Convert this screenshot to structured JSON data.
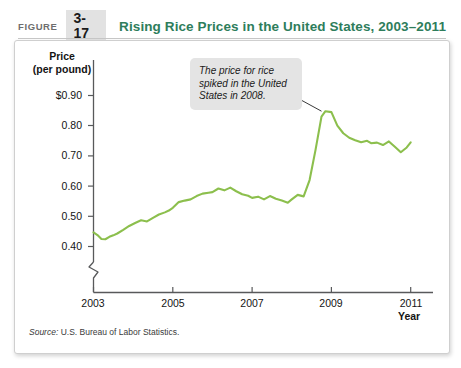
{
  "figure": {
    "label": "FIGURE",
    "number": "3-17",
    "title": "Rising Rice Prices in the United States, 2003–2011"
  },
  "axes": {
    "y_title_line1": "Price",
    "y_title_line2": "(per pound)",
    "x_title": "Year",
    "y_ticks": [
      "$0.90",
      "0.80",
      "0.70",
      "0.60",
      "0.50",
      "0.40"
    ],
    "x_ticks": [
      "2003",
      "2005",
      "2007",
      "2009",
      "2011"
    ]
  },
  "annotation": {
    "text": "The price for rice spiked in the United States in 2008."
  },
  "source": {
    "prefix": "Source:",
    "text": "U.S. Bureau of Labor Statistics."
  },
  "colors": {
    "line": "#8CBF4D",
    "title": "#2e7d5b",
    "figure_box_bg": "#e2e2e2",
    "callout_bg": "#e4e4e4",
    "axis": "#58595b"
  },
  "chart_data": {
    "type": "line",
    "title": "Rising Rice Prices in the United States, 2003–2011",
    "xlabel": "Year",
    "ylabel": "Price (per pound)",
    "xlim": [
      2003,
      2011.2
    ],
    "ylim": [
      0.37,
      0.93
    ],
    "ybreak": true,
    "grid": false,
    "legend": null,
    "series": [
      {
        "name": "Rice price (dollars per pound)",
        "x": [
          2003.0,
          2003.1,
          2003.2,
          2003.3,
          2003.4,
          2003.5,
          2003.6,
          2003.75,
          2003.9,
          2004.05,
          2004.2,
          2004.35,
          2004.5,
          2004.65,
          2004.8,
          2004.9,
          2005.0,
          2005.15,
          2005.3,
          2005.45,
          2005.6,
          2005.75,
          2005.9,
          2006.0,
          2006.15,
          2006.3,
          2006.45,
          2006.6,
          2006.75,
          2006.9,
          2007.0,
          2007.15,
          2007.3,
          2007.45,
          2007.6,
          2007.75,
          2007.9,
          2008.0,
          2008.15,
          2008.3,
          2008.45,
          2008.6,
          2008.75,
          2008.85,
          2009.0,
          2009.15,
          2009.3,
          2009.45,
          2009.6,
          2009.75,
          2009.9,
          2010.0,
          2010.15,
          2010.3,
          2010.45,
          2010.6,
          2010.75,
          2010.9,
          2011.0
        ],
        "y": [
          0.447,
          0.438,
          0.425,
          0.424,
          0.432,
          0.437,
          0.443,
          0.455,
          0.468,
          0.478,
          0.487,
          0.483,
          0.495,
          0.506,
          0.513,
          0.519,
          0.528,
          0.547,
          0.552,
          0.556,
          0.567,
          0.575,
          0.578,
          0.58,
          0.592,
          0.586,
          0.595,
          0.583,
          0.573,
          0.568,
          0.561,
          0.565,
          0.556,
          0.567,
          0.558,
          0.552,
          0.545,
          0.556,
          0.571,
          0.566,
          0.62,
          0.72,
          0.83,
          0.848,
          0.845,
          0.8,
          0.775,
          0.76,
          0.752,
          0.745,
          0.75,
          0.742,
          0.744,
          0.736,
          0.748,
          0.73,
          0.712,
          0.728,
          0.745
        ]
      }
    ],
    "annotations": [
      {
        "text": "The price for rice spiked in the United States in 2008.",
        "point_x": 2008.75,
        "point_y": 0.848
      }
    ]
  }
}
